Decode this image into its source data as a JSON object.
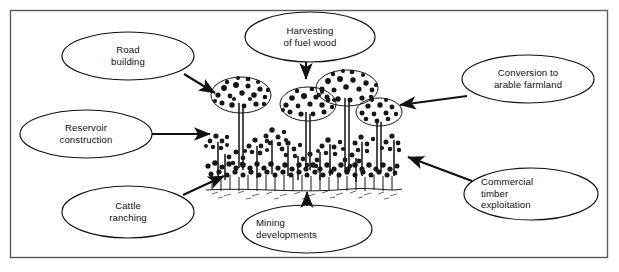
{
  "figure": {
    "kind": "causes-of-deforestation-diagram",
    "frame": {
      "stroke": "#555555",
      "fill": "#ffffff"
    },
    "ink_color": "#111111",
    "center_illustration": {
      "name": "tropical-rainforest-illustration",
      "description": "Dense tropical rainforest with tall emergent trees, continuous canopy and shrub layer above a ground line"
    },
    "nodes": [
      {
        "id": "road-building",
        "label": "Road\nbuilding",
        "side": "left",
        "cx": 128,
        "cy": 56,
        "rx": 66,
        "ry": 24,
        "text_x": 62,
        "text_y": 44,
        "text_w": 132,
        "align": "center"
      },
      {
        "id": "harvesting-fuel-wood",
        "label": "Harvesting\nof fuel wood",
        "side": "top",
        "cx": 310,
        "cy": 37,
        "rx": 65,
        "ry": 25,
        "text_x": 245,
        "text_y": 25,
        "text_w": 130,
        "align": "center"
      },
      {
        "id": "conversion-arable-farmland",
        "label": "Conversion to\narable farmland",
        "side": "right",
        "cx": 528,
        "cy": 79,
        "rx": 66,
        "ry": 24,
        "text_x": 462,
        "text_y": 67,
        "text_w": 132,
        "align": "center"
      },
      {
        "id": "reservoir-construction",
        "label": "Reservoir\nconstruction",
        "side": "left",
        "cx": 86,
        "cy": 134,
        "rx": 66,
        "ry": 24,
        "text_x": 20,
        "text_y": 122,
        "text_w": 132,
        "align": "center"
      },
      {
        "id": "commercial-timber-exploitation",
        "label": "Commercial\ntimber\nexploitation",
        "side": "right",
        "cx": 531,
        "cy": 194,
        "rx": 67,
        "ry": 26,
        "text_x": 481,
        "text_y": 176,
        "text_w": 110,
        "align": "left"
      },
      {
        "id": "cattle-ranching",
        "label": "Cattle\nranching",
        "side": "left",
        "cx": 128,
        "cy": 212,
        "rx": 66,
        "ry": 26,
        "text_x": 62,
        "text_y": 200,
        "text_w": 132,
        "align": "center"
      },
      {
        "id": "mining-developments",
        "label": "Mining\ndevelopments",
        "side": "bottom",
        "cx": 307,
        "cy": 229,
        "rx": 65,
        "ry": 24,
        "text_x": 247,
        "text_y": 217,
        "text_w": 130,
        "align": "left"
      }
    ],
    "arrows": [
      {
        "id": "arrow-road-building",
        "from": "road-building",
        "to": "forest",
        "x1": 184,
        "y1": 74,
        "x2": 219,
        "y2": 95
      },
      {
        "id": "arrow-harvesting-fuel-wood",
        "from": "harvesting-fuel-wood",
        "to": "forest",
        "x1": 306,
        "y1": 62,
        "x2": 306,
        "y2": 82
      },
      {
        "id": "arrow-conversion-arable-farmland",
        "from": "conversion-arable-farmland",
        "to": "forest",
        "x1": 466,
        "y1": 96,
        "x2": 396,
        "y2": 105
      },
      {
        "id": "arrow-reservoir-construction",
        "from": "reservoir-construction",
        "to": "forest",
        "x1": 152,
        "y1": 134,
        "x2": 213,
        "y2": 134
      },
      {
        "id": "arrow-commercial-timber-exploitation",
        "from": "commercial-timber-exploitation",
        "to": "forest",
        "x1": 472,
        "y1": 181,
        "x2": 404,
        "y2": 156
      },
      {
        "id": "arrow-cattle-ranching",
        "from": "cattle-ranching",
        "to": "forest",
        "x1": 183,
        "y1": 195,
        "x2": 221,
        "y2": 176
      },
      {
        "id": "arrow-mining-developments",
        "from": "mining-developments",
        "to": "forest",
        "x1": 307,
        "y1": 206,
        "x2": 307,
        "y2": 190
      }
    ]
  }
}
